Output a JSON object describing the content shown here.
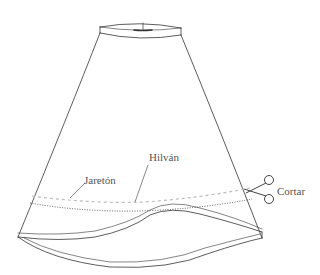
{
  "figure": {
    "labels": {
      "hilvan": "Hilván",
      "jareton": "Jaretón",
      "cortar": "Cortar"
    },
    "icons": {
      "scissors": "scissors-icon"
    },
    "colors": {
      "outline": "#333333",
      "basting": "#bbbbbb",
      "stitch": "#333333",
      "label": "#555555",
      "background": "#ffffff"
    }
  }
}
